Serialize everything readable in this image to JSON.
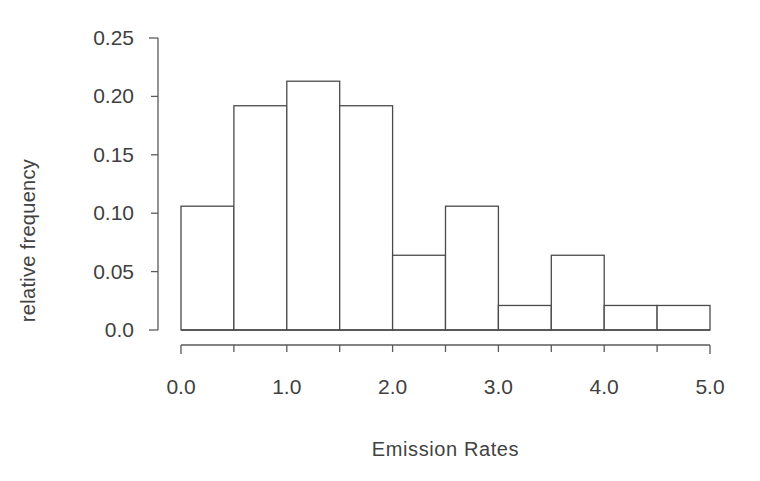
{
  "chart_data": {
    "type": "bar",
    "title": "",
    "xlabel": "Emission Rates",
    "ylabel": "relative frequency",
    "grid": false,
    "legend": null,
    "bin_width": 0.5,
    "bin_edges": [
      0.0,
      0.5,
      1.0,
      1.5,
      2.0,
      2.5,
      3.0,
      3.5,
      4.0,
      4.5,
      5.0
    ],
    "categories": [
      "0.0-0.5",
      "0.5-1.0",
      "1.0-1.5",
      "1.5-2.0",
      "2.0-2.5",
      "2.5-3.0",
      "3.0-3.5",
      "3.5-4.0",
      "4.0-4.5",
      "4.5-5.0"
    ],
    "values": [
      0.106,
      0.192,
      0.213,
      0.192,
      0.064,
      0.106,
      0.021,
      0.064,
      0.021,
      0.021
    ],
    "xlim": [
      0.0,
      5.0
    ],
    "ylim": [
      0.0,
      0.25
    ],
    "xticks": [
      0.0,
      0.5,
      1.0,
      1.5,
      2.0,
      2.5,
      3.0,
      3.5,
      4.0,
      4.5,
      5.0
    ],
    "xtick_labels_shown": [
      {
        "value": 0.0,
        "label": "0.0"
      },
      {
        "value": 1.0,
        "label": "1.0"
      },
      {
        "value": 2.0,
        "label": "2.0"
      },
      {
        "value": 3.0,
        "label": "3.0"
      },
      {
        "value": 4.0,
        "label": "4.0"
      },
      {
        "value": 5.0,
        "label": "5.0"
      }
    ],
    "yticks": [
      0.0,
      0.05,
      0.1,
      0.15,
      0.2,
      0.25
    ],
    "ytick_labels": [
      "0.0",
      "0.05",
      "0.10",
      "0.15",
      "0.20",
      "0.25"
    ],
    "bar_fill": "#ffffff",
    "bar_edge": "#4a4a4a",
    "axis_color": "#5a5a5a",
    "text_color": "#3f3f3f"
  },
  "axes": {
    "y_labels": [
      {
        "value": 0.25,
        "text": "0.25"
      },
      {
        "value": 0.2,
        "text": "0.20"
      },
      {
        "value": 0.15,
        "text": "0.15"
      },
      {
        "value": 0.1,
        "text": "0.10"
      },
      {
        "value": 0.05,
        "text": "0.05"
      },
      {
        "value": 0.0,
        "text": "0.0"
      }
    ],
    "x_labels": [
      {
        "value": 0.0,
        "text": "0.0"
      },
      {
        "value": 1.0,
        "text": "1.0"
      },
      {
        "value": 2.0,
        "text": "2.0"
      },
      {
        "value": 3.0,
        "text": "3.0"
      },
      {
        "value": 4.0,
        "text": "4.0"
      },
      {
        "value": 5.0,
        "text": "5.0"
      }
    ]
  }
}
